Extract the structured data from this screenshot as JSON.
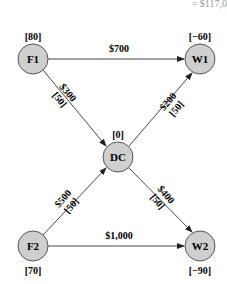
{
  "top_partial_text": "= $117,0",
  "nodes": {
    "F1": {
      "label": "F1",
      "supply": "[80]"
    },
    "W1": {
      "label": "W1",
      "supply": "[−60]"
    },
    "DC": {
      "label": "DC",
      "supply": "[0]"
    },
    "F2": {
      "label": "F2",
      "supply": "[70]"
    },
    "W2": {
      "label": "W2",
      "supply": "[−90]"
    }
  },
  "edges": {
    "F1_W1": {
      "cost": "$700"
    },
    "F1_DC": {
      "cost": "$300",
      "capacity": "[50]"
    },
    "DC_W1": {
      "cost": "$200",
      "capacity": "[50]"
    },
    "F2_DC": {
      "cost": "$500",
      "capacity": "[50]"
    },
    "DC_W2": {
      "cost": "$400",
      "capacity": "[50]"
    },
    "F2_W2": {
      "cost": "$1,000"
    }
  }
}
